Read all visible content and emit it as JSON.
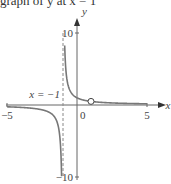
{
  "caption": "graph of y at x = 1",
  "chart_data": {
    "type": "line",
    "title": "",
    "xlabel": "x",
    "ylabel": "y",
    "xlim": [
      -5,
      5
    ],
    "ylim": [
      -10,
      10
    ],
    "x_ticks": [
      {
        "value": -5,
        "label": "-5"
      },
      {
        "value": 0,
        "label": "0"
      },
      {
        "value": 5,
        "label": "5"
      }
    ],
    "y_ticks": [
      {
        "value": 10,
        "label": "10"
      },
      {
        "value": -10,
        "label": "-10"
      }
    ],
    "function": "y = 1/(x+1)",
    "vertical_asymptote": {
      "x": -1,
      "label": "x = −1"
    },
    "hole": {
      "x": 1,
      "y": 0.5
    },
    "colors": {
      "curve": "#777777",
      "axis": "#666666",
      "asymptote": "#888888"
    }
  }
}
